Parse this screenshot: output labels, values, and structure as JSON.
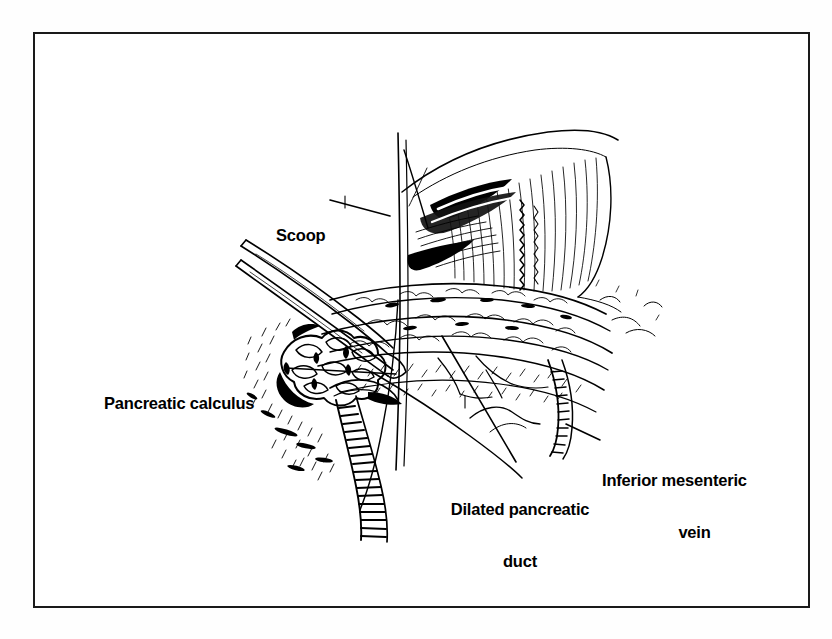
{
  "figure": {
    "kind": "surgical-line-illustration",
    "border_color": "#1a1a1a",
    "ink_color": "#000000",
    "background_color": "#ffffff"
  },
  "labels": [
    {
      "id": "scoop",
      "name": "label-scoop",
      "lines": [
        "Scoop"
      ],
      "align": "left",
      "leader": "line from label right edge angling down-right to the instrument shaft"
    },
    {
      "id": "pancreatic_calculus",
      "name": "label-pancreatic-calculus",
      "lines": [
        "Pancreatic calculus"
      ],
      "align": "left",
      "leader": "horizontal line from label right edge to the calculus cluster"
    },
    {
      "id": "dilated_pancreatic_duct",
      "name": "label-dilated-pancreatic-duct",
      "lines": [
        "Dilated pancreatic",
        "duct"
      ],
      "align": "center",
      "leader": "long diagonal line from above the label up-left into the opened duct"
    },
    {
      "id": "inferior_mesenteric_vein",
      "name": "label-inferior-mesenteric-vein",
      "lines": [
        "Inferior mesenteric",
        "vein"
      ],
      "align": "center",
      "leader": "short diagonal line from label left edge up-left to the vein"
    }
  ],
  "anatomy_parts": [
    "retracted peritoneal flap",
    "transverse mesocolon edge",
    "pancreatic body and tail",
    "opened dilated pancreatic duct",
    "pancreatic calculi cluster",
    "inferior mesenteric vein",
    "surgical scoop instrument"
  ]
}
